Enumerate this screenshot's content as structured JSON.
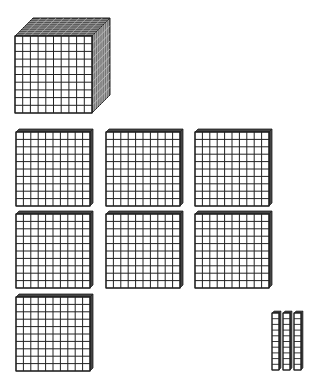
{
  "colors": {
    "line": "#222222",
    "face": "#ffffff",
    "dark": "#444444",
    "side": "#666666"
  },
  "blocks": {
    "thousands": {
      "count": 1,
      "label": "thousand cube"
    },
    "hundreds": {
      "count": 7,
      "label": "hundred flat"
    },
    "tens": {
      "count": 3,
      "label": "ten rod"
    },
    "ones": {
      "count": 0,
      "label": "unit cube"
    }
  },
  "represented_value": "1730",
  "cube": {
    "x": 15,
    "y": 36,
    "size": 77,
    "depth": 18
  },
  "flats": [
    {
      "x": 16,
      "y": 132
    },
    {
      "x": 106,
      "y": 132
    },
    {
      "x": 195,
      "y": 132
    },
    {
      "x": 16,
      "y": 214
    },
    {
      "x": 106,
      "y": 214
    },
    {
      "x": 195,
      "y": 214
    },
    {
      "x": 16,
      "y": 297
    }
  ],
  "flat_size": 74,
  "rods": [
    {
      "x": 272,
      "y": 313
    },
    {
      "x": 283,
      "y": 313
    },
    {
      "x": 294,
      "y": 313
    }
  ],
  "rod": {
    "w": 7,
    "h": 57
  }
}
